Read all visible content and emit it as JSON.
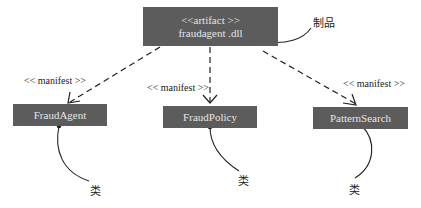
{
  "diagram": {
    "type": "UML deployment / manifestation diagram",
    "artifact": {
      "stereotype": "<<artifact >>",
      "name": "fraudagent .dll",
      "note": "制品"
    },
    "dependency_label": "<< manifest >>",
    "dependencies": [
      {
        "label": "<< manifest >>",
        "from": "fraudagent .dll",
        "to": "FraudAgent"
      },
      {
        "label": "<< manifest >>",
        "from": "fraudagent .dll",
        "to": "FraudPolicy"
      },
      {
        "label": "<< manifest >>",
        "from": "fraudagent .dll",
        "to": "PatternSearch"
      }
    ],
    "classes": [
      {
        "name": "FraudAgent",
        "note": "类"
      },
      {
        "name": "FraudPolicy",
        "note": "类"
      },
      {
        "name": "PatternSearch",
        "note": "类"
      }
    ],
    "colors": {
      "box_fill": "#5c5c5c",
      "box_text": "#e4e4e4",
      "line": "#222222",
      "background": "#ffffff"
    }
  }
}
